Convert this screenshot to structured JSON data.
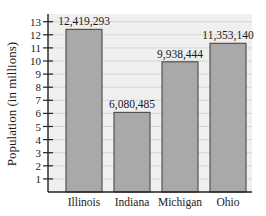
{
  "chart_data": {
    "type": "bar",
    "title": "",
    "xlabel": "",
    "ylabel": "Population (in millions)",
    "categories": [
      "Illinois",
      "Indiana",
      "Michigan",
      "Ohio"
    ],
    "values": [
      12419293,
      6080485,
      9938444,
      11353140
    ],
    "data_labels": [
      "12,419,293",
      "6,080,485",
      "9,938,444",
      "11,353,140"
    ],
    "ylim": [
      0,
      13
    ],
    "yticks": [
      1,
      2,
      3,
      4,
      5,
      6,
      7,
      8,
      9,
      10,
      11,
      12,
      13
    ],
    "grid": true,
    "legend": null
  },
  "colors": {
    "plot_bg": "#efefef",
    "grid": "#d4d4d4",
    "bar_fill": "#a9a9a9",
    "bar_stroke": "#3a3a3a",
    "axis": "#222222",
    "text": "#1a1a1a"
  }
}
